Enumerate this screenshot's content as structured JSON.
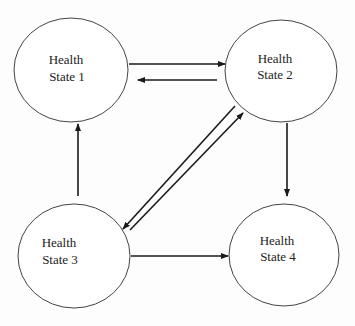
{
  "diagram": {
    "type": "state-transition",
    "nodes": [
      {
        "id": "s1",
        "line1": "Health",
        "line2": "State 1"
      },
      {
        "id": "s2",
        "line1": "Health",
        "line2": "State 2"
      },
      {
        "id": "s3",
        "line1": "Health",
        "line2": "State 3"
      },
      {
        "id": "s4",
        "line1": "Health",
        "line2": "State 4"
      }
    ],
    "edges": [
      {
        "from": "s1",
        "to": "s2"
      },
      {
        "from": "s2",
        "to": "s1"
      },
      {
        "from": "s2",
        "to": "s4"
      },
      {
        "from": "s2",
        "to": "s3"
      },
      {
        "from": "s3",
        "to": "s2"
      },
      {
        "from": "s3",
        "to": "s1"
      },
      {
        "from": "s3",
        "to": "s4"
      }
    ],
    "colors": {
      "line": "#1a1a1a",
      "outline": "#444444",
      "background": "#ffffff"
    }
  }
}
